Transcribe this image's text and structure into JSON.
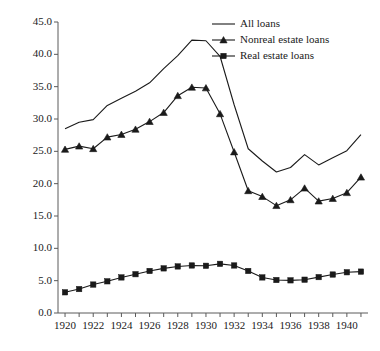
{
  "chart_data": {
    "type": "line",
    "title": "",
    "xlabel": "",
    "ylabel": "1920 $ Billions",
    "xlim": [
      1919.5,
      1941.5
    ],
    "ylim": [
      0.0,
      45.0
    ],
    "grid": false,
    "legend_position": "top-right",
    "x": [
      1920,
      1921,
      1922,
      1923,
      1924,
      1925,
      1926,
      1927,
      1928,
      1929,
      1930,
      1931,
      1932,
      1933,
      1934,
      1935,
      1936,
      1937,
      1938,
      1939,
      1940,
      1941
    ],
    "xticks": [
      1920,
      1921,
      1922,
      1923,
      1924,
      1925,
      1926,
      1927,
      1928,
      1929,
      1930,
      1931,
      1932,
      1933,
      1934,
      1935,
      1936,
      1937,
      1938,
      1939,
      1940,
      1941
    ],
    "xtick_labels": [
      "1920",
      "",
      "1922",
      "",
      "1924",
      "",
      "1926",
      "",
      "1928",
      "",
      "1930",
      "",
      "1932",
      "",
      "1934",
      "",
      "1936",
      "",
      "1938",
      "",
      "1940",
      ""
    ],
    "yticks": [
      0.0,
      5.0,
      10.0,
      15.0,
      20.0,
      25.0,
      30.0,
      35.0,
      40.0,
      45.0
    ],
    "ytick_labels": [
      "0.0",
      "5.0",
      "10.0",
      "15.0",
      "20.0",
      "25.0",
      "30.0",
      "35.0",
      "40.0",
      "45.0"
    ],
    "series": [
      {
        "name": "All loans",
        "marker": "none",
        "color": "#1a1a1a",
        "values": [
          28.5,
          29.5,
          29.9,
          32.1,
          33.2,
          34.3,
          35.6,
          37.8,
          39.8,
          42.2,
          42.1,
          39.7,
          32.2,
          25.4,
          23.5,
          21.8,
          22.5,
          24.5,
          22.9,
          24.0,
          25.1,
          27.6
        ]
      },
      {
        "name": "Nonreal estate loans",
        "marker": "triangle",
        "color": "#1a1a1a",
        "values": [
          25.3,
          25.8,
          25.4,
          27.2,
          27.6,
          28.4,
          29.6,
          31.0,
          33.6,
          34.9,
          34.8,
          30.8,
          24.9,
          18.9,
          18.0,
          16.6,
          17.5,
          19.3,
          17.3,
          17.7,
          18.6,
          21.0
        ]
      },
      {
        "name": "Real estate loans",
        "marker": "square",
        "color": "#1a1a1a",
        "values": [
          3.2,
          3.7,
          4.4,
          4.9,
          5.5,
          6.0,
          6.5,
          6.9,
          7.2,
          7.35,
          7.3,
          7.6,
          7.35,
          6.5,
          5.5,
          5.1,
          5.05,
          5.15,
          5.55,
          5.95,
          6.3,
          6.4
        ]
      }
    ]
  },
  "legend": {
    "items": [
      {
        "label": "All loans",
        "marker": "none"
      },
      {
        "label": "Nonreal estate loans",
        "marker": "triangle"
      },
      {
        "label": "Real estate loans",
        "marker": "square"
      }
    ]
  },
  "axis": {
    "y_title": "1920 $ Billions"
  }
}
